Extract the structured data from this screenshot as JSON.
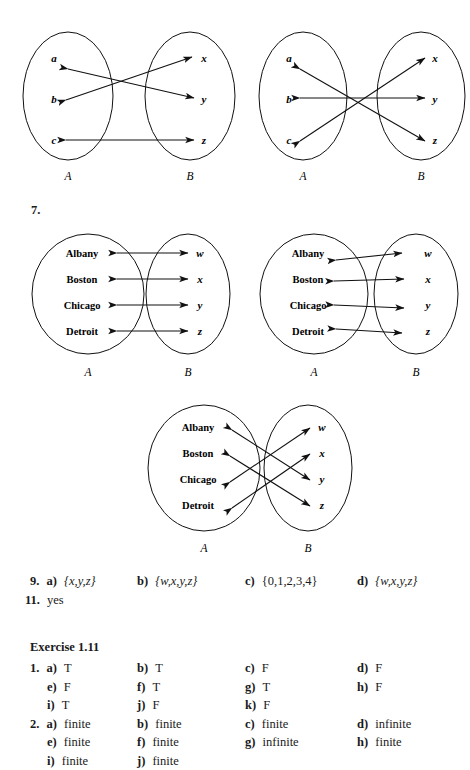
{
  "page": {
    "exercise_number_label": "7.",
    "exercise_header": "Exercise 1.11"
  },
  "diagrams": [
    {
      "id": "diagram-1",
      "set_a_label": "A",
      "set_b_label": "B",
      "left_elements": [
        "a",
        "b",
        "c"
      ],
      "right_elements": [
        "x",
        "y",
        "z"
      ],
      "style": "crossing",
      "mappings": [
        {
          "from": "a",
          "to": "y",
          "double_headed": true
        },
        {
          "from": "b",
          "to": "x",
          "double_headed": true
        },
        {
          "from": "c",
          "to": "z",
          "double_headed": true
        }
      ]
    },
    {
      "id": "diagram-2",
      "set_a_label": "A",
      "set_b_label": "B",
      "left_elements": [
        "a",
        "b",
        "c"
      ],
      "right_elements": [
        "x",
        "y",
        "z"
      ],
      "style": "converging",
      "mappings": [
        {
          "from": "a",
          "to": "z",
          "double_headed": true
        },
        {
          "from": "b",
          "to": "y",
          "double_headed": true
        },
        {
          "from": "c",
          "to": "x",
          "double_headed": true
        }
      ]
    },
    {
      "id": "diagram-3",
      "set_a_label": "A",
      "set_b_label": "B",
      "left_elements": [
        "Albany",
        "Boston",
        "Chicago",
        "Detroit"
      ],
      "right_elements": [
        "w",
        "x",
        "y",
        "z"
      ],
      "style": "parallel",
      "mappings": [
        {
          "from": "Albany",
          "to": "w",
          "double_headed": true
        },
        {
          "from": "Boston",
          "to": "x",
          "double_headed": true
        },
        {
          "from": "Chicago",
          "to": "y",
          "double_headed": true
        },
        {
          "from": "Detroit",
          "to": "z",
          "double_headed": true
        }
      ]
    },
    {
      "id": "diagram-4",
      "set_a_label": "A",
      "set_b_label": "B",
      "left_elements": [
        "Albany",
        "Boston",
        "Chicago",
        "Detroit"
      ],
      "right_elements": [
        "w",
        "x",
        "y",
        "z"
      ],
      "style": "converging",
      "mappings": [
        {
          "from": "Albany",
          "to": "w",
          "double_headed": true
        },
        {
          "from": "Boston",
          "to": "x",
          "double_headed": true
        },
        {
          "from": "Chicago",
          "to": "y",
          "double_headed": true
        },
        {
          "from": "Detroit",
          "to": "z",
          "double_headed": true
        }
      ]
    },
    {
      "id": "diagram-5",
      "set_a_label": "A",
      "set_b_label": "B",
      "left_elements": [
        "Albany",
        "Boston",
        "Chicago",
        "Detroit"
      ],
      "right_elements": [
        "w",
        "x",
        "y",
        "z"
      ],
      "style": "crossing",
      "mappings": [
        {
          "from": "Albany",
          "to": "y",
          "double_headed": true
        },
        {
          "from": "Boston",
          "to": "z",
          "double_headed": true
        },
        {
          "from": "Chicago",
          "to": "w",
          "double_headed": true
        },
        {
          "from": "Detroit",
          "to": "x",
          "double_headed": true
        }
      ]
    }
  ],
  "answers": [
    {
      "number": "9.",
      "rows": [
        [
          {
            "part": "a)",
            "value": "{x,y,z}",
            "italic": true
          },
          {
            "part": "b)",
            "value": "{w,x,y,z}",
            "italic": true
          },
          {
            "part": "c)",
            "value": "{0,1,2,3,4}",
            "italic": false
          },
          {
            "part": "d)",
            "value": "{w,x,y,z}",
            "italic": true
          }
        ]
      ]
    },
    {
      "number": "11.",
      "rows": [
        [
          {
            "part": "",
            "value": "yes",
            "italic": false
          }
        ]
      ]
    }
  ],
  "exercise_answers": [
    {
      "number": "1.",
      "rows": [
        [
          {
            "part": "a)",
            "value": "T"
          },
          {
            "part": "b)",
            "value": "T"
          },
          {
            "part": "c)",
            "value": "F"
          },
          {
            "part": "d)",
            "value": "F"
          }
        ],
        [
          {
            "part": "e)",
            "value": "F"
          },
          {
            "part": "f)",
            "value": "T"
          },
          {
            "part": "g)",
            "value": "T"
          },
          {
            "part": "h)",
            "value": "F"
          }
        ],
        [
          {
            "part": "i)",
            "value": "T"
          },
          {
            "part": "j)",
            "value": "F"
          },
          {
            "part": "k)",
            "value": "F"
          }
        ]
      ]
    },
    {
      "number": "2.",
      "rows": [
        [
          {
            "part": "a)",
            "value": "finite"
          },
          {
            "part": "b)",
            "value": "finite"
          },
          {
            "part": "c)",
            "value": "finite"
          },
          {
            "part": "d)",
            "value": "infinite"
          }
        ],
        [
          {
            "part": "e)",
            "value": "finite"
          },
          {
            "part": "f)",
            "value": "finite"
          },
          {
            "part": "g)",
            "value": "infinite"
          },
          {
            "part": "h)",
            "value": "finite"
          }
        ],
        [
          {
            "part": "i)",
            "value": "finite"
          },
          {
            "part": "j)",
            "value": "finite"
          }
        ]
      ]
    }
  ]
}
